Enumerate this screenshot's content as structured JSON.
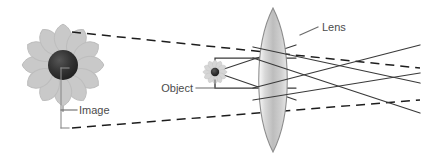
{
  "figure": {
    "kind": "optics-ray-diagram",
    "title": "",
    "width": 426,
    "height": 160,
    "background": "#ffffff"
  },
  "labels": {
    "lens": "Lens",
    "object": "Object",
    "image": "Image"
  },
  "colors": {
    "ray_solid": "#3a3a3a",
    "ray_dashed": "#1a1a1a",
    "leader_line": "#6b6b6b",
    "label_text": "#4b4b4b",
    "lens_fill_light": "#f2f2f2",
    "lens_fill_mid": "#c8c8c8",
    "lens_fill_dark": "#9a9a9a",
    "lens_stroke": "#8c8c8c",
    "petal_fill": "#c9c9c9",
    "petal_stroke": "#bdbdbd",
    "disc_dark": "#2b2b2b",
    "disc_light": "#4a4a4a",
    "stem": "#9a9a9a"
  },
  "elements": {
    "lens": {
      "name": "converging-lens",
      "center_x": 273,
      "top_y": 8,
      "bottom_y": 152,
      "half_width": 19
    },
    "object_flower": {
      "name": "object-flower",
      "cx": 215,
      "cy": 72,
      "disc_r": 4.2,
      "petal_count": 12,
      "petal_len": 9
    },
    "image_flower": {
      "name": "image-flower",
      "cx": 63,
      "cy": 65,
      "disc_r": 15,
      "petal_count": 12,
      "petal_len": 30
    },
    "image_bracket": {
      "name": "image-size-bracket",
      "x": 61,
      "top_y": 68,
      "bottom_y": 128,
      "tick_len": 8
    }
  },
  "label_positions": {
    "lens": {
      "text_x": 327,
      "text_y": 30,
      "leader": "M 300 35 L 318 27"
    },
    "object": {
      "text_x": 166,
      "text_y": 92,
      "leader": "M 196 88 L 215 88 L 215 80"
    },
    "image": {
      "text_x": 80,
      "text_y": 114,
      "leader": "M 61 110 L 77 110"
    }
  },
  "rays": {
    "solid_from_object": [
      {
        "name": "ray-upper-parallel",
        "d": "M 215 72 L 215 58 L 296 58"
      },
      {
        "name": "ray-lower-parallel",
        "d": "M 215 72 L 215 88 L 296 88"
      },
      {
        "name": "ray-up-diagonal",
        "d": "M 215 72 L 296 45"
      },
      {
        "name": "ray-down-diagonal",
        "d": "M 215 72 L 296 100"
      }
    ],
    "solid_after_lens": [
      {
        "name": "refracted-ray-1",
        "d": "M 253 58 L 420 113"
      },
      {
        "name": "refracted-ray-2",
        "d": "M 253 88 L 420 45"
      },
      {
        "name": "refracted-ray-3",
        "d": "M 253 47 L 420 83"
      },
      {
        "name": "refracted-ray-4",
        "d": "M 253 100 L 420 73"
      }
    ],
    "dashed_virtual": [
      {
        "name": "virtual-ray-upper",
        "d": "M 72 32 L 420 68"
      },
      {
        "name": "virtual-ray-lower",
        "d": "M 72 128 L 420 100"
      }
    ]
  }
}
